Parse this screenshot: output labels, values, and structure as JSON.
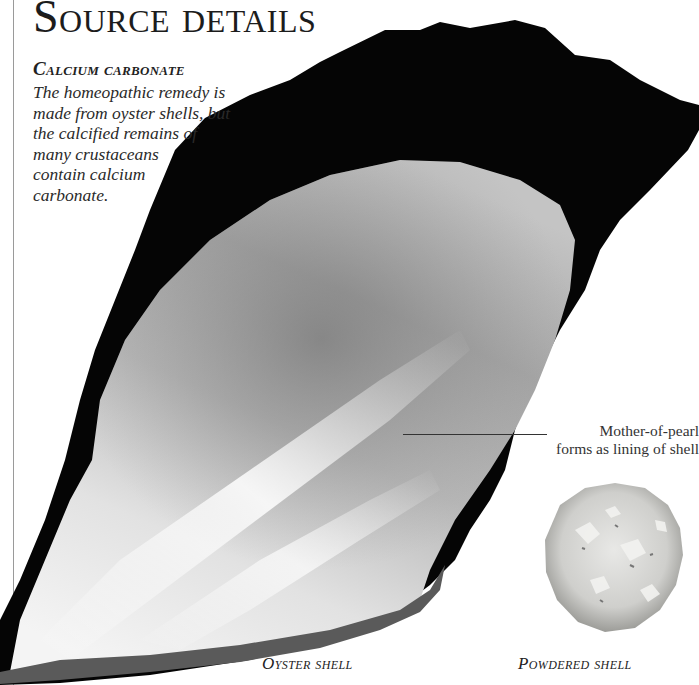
{
  "page": {
    "title": "Source details",
    "section": {
      "heading": "Calcium carbonate",
      "body_lines": [
        "The homeopathic remedy is",
        "made from oyster shells, but",
        "the calcified remains of",
        "many crustaceans",
        "contain calcium",
        "carbonate."
      ]
    },
    "callout": {
      "lines": [
        "Mother-of-pearl",
        "forms as lining of shell"
      ]
    },
    "captions": {
      "oyster": "Oyster shell",
      "powder": "Powdered shell"
    }
  },
  "images": {
    "oyster_shell": "oyster-shell-photo",
    "powdered_shell": "powdered-shell-photo"
  }
}
